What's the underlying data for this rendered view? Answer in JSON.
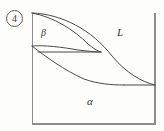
{
  "figure": {
    "item_number": "4",
    "kind": "binary-phase-diagram",
    "background_color": "#fdfdfc",
    "line_color": "#4a4a4a",
    "text_color": "#333333"
  },
  "plot_box": {
    "left": 32,
    "top": 13,
    "right": 155,
    "bottom": 124,
    "border_color": "#8c8c8c"
  },
  "labels": {
    "liquid": "L",
    "alpha": "α",
    "beta": "β"
  },
  "chart_data": {
    "type": "line",
    "title": "",
    "xlabel": "",
    "ylabel": "",
    "grid": false,
    "legend_position": "inline-annotations",
    "axis_box": {
      "x": [
        32,
        155
      ],
      "y": [
        13,
        124
      ]
    },
    "annotations": [
      {
        "text": "L",
        "x": 120,
        "y": 33,
        "role": "liquid-phase-field"
      },
      {
        "text": "α",
        "x": 90,
        "y": 101,
        "role": "alpha-phase-field"
      },
      {
        "text": "β",
        "x": 44,
        "y": 33,
        "role": "beta-phase-field"
      },
      {
        "text": "4",
        "x": 14,
        "y": 18,
        "role": "item-number-circled"
      }
    ],
    "series": [
      {
        "name": "liquidus",
        "path": "M 32 13 C 62 14, 92 30, 112 56 C 126 73, 142 82, 155 85",
        "points": [
          [
            32,
            13
          ],
          [
            60,
            20
          ],
          [
            85,
            35
          ],
          [
            104,
            50
          ],
          [
            122,
            68
          ],
          [
            140,
            80
          ],
          [
            155,
            85
          ]
        ]
      },
      {
        "name": "beta-solidus",
        "path": "M 32 13 C 54 17, 74 30, 88 44 C 93 48, 97 51, 101 52",
        "points": [
          [
            32,
            13
          ],
          [
            50,
            18
          ],
          [
            66,
            26
          ],
          [
            80,
            36
          ],
          [
            92,
            46
          ],
          [
            101,
            52
          ]
        ]
      },
      {
        "name": "beta-solvus",
        "path": "M 32 46 C 44 45, 62 47, 78 50 C 87 51, 95 52, 101 52",
        "points": [
          [
            32,
            46
          ],
          [
            48,
            46
          ],
          [
            64,
            48
          ],
          [
            80,
            50
          ],
          [
            92,
            51
          ],
          [
            101,
            52
          ]
        ]
      },
      {
        "name": "peritectic-horizontal",
        "path": "M 38 52 L 101 52",
        "points": [
          [
            38,
            52
          ],
          [
            101,
            52
          ]
        ]
      },
      {
        "name": "alpha-solvus",
        "path": "M 32 46 C 46 57, 64 70, 84 79 C 98 84, 112 85, 124 85",
        "points": [
          [
            32,
            46
          ],
          [
            50,
            60
          ],
          [
            68,
            72
          ],
          [
            86,
            80
          ],
          [
            104,
            84
          ],
          [
            124,
            85
          ]
        ]
      },
      {
        "name": "alpha-liquidus-tieline",
        "path": "M 124 85 L 155 85",
        "points": [
          [
            124,
            85
          ],
          [
            155,
            85
          ]
        ]
      }
    ]
  }
}
